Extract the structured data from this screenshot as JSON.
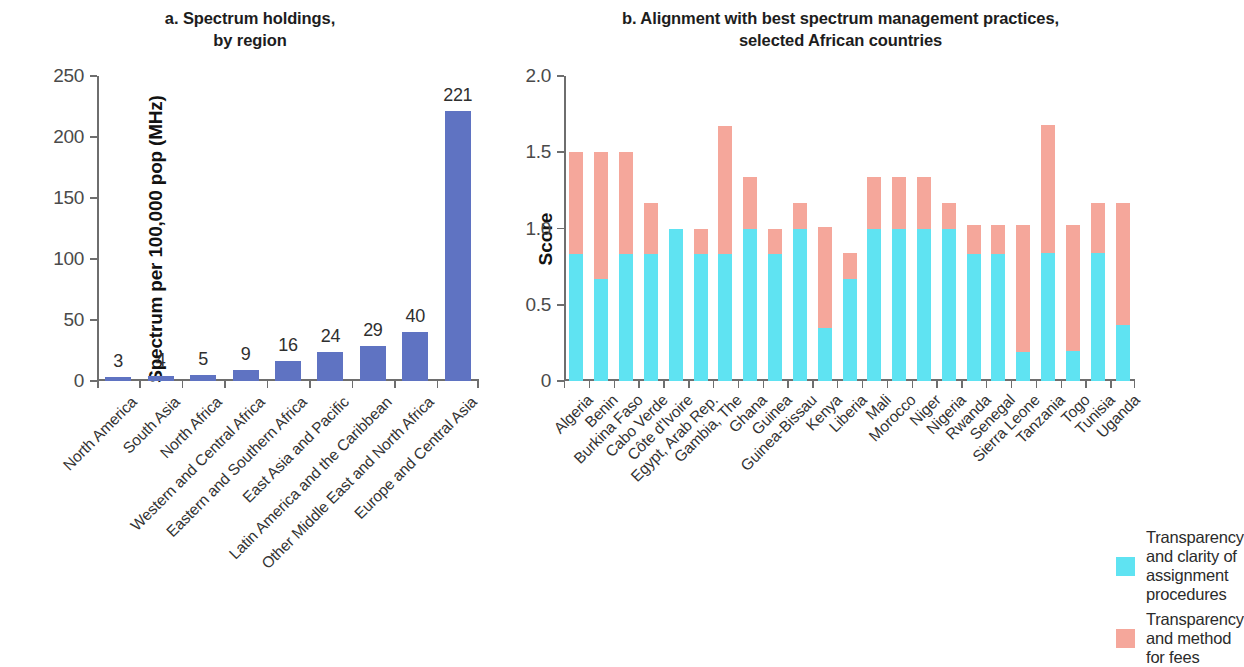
{
  "chart_data": [
    {
      "type": "bar",
      "panel": "a",
      "title": "a. Spectrum holdings,\nby region",
      "title_line1": "a. Spectrum holdings,",
      "title_line2": "by region",
      "xlabel": "",
      "ylabel": "Spectrum per 100,000 pop (MHz)",
      "ylim": [
        0,
        250
      ],
      "yticks": [
        0,
        50,
        100,
        150,
        200,
        250
      ],
      "ytick_labels": [
        "0",
        "50",
        "100",
        "150",
        "200",
        "250"
      ],
      "grid": false,
      "legend": "none",
      "bar_color": "#5f73c2",
      "categories": [
        "North America",
        "South Asia",
        "North Africa",
        "Western and Central Africa",
        "Eastern and Southern Africa",
        "East Asia and Pacific",
        "Latin America and the Caribbean",
        "Other Middle East and North Africa",
        "Europe and Central Asia"
      ],
      "values": [
        3,
        4,
        5,
        9,
        16,
        24,
        29,
        40,
        221
      ],
      "value_labels": [
        "3",
        "4",
        "5",
        "9",
        "16",
        "24",
        "29",
        "40",
        "221"
      ]
    },
    {
      "type": "bar",
      "panel": "b",
      "stacked": true,
      "title": "b. Alignment with best spectrum management practices,\nselected African countries",
      "title_line1": "b. Alignment with best spectrum management practices,",
      "title_line2": "selected African countries",
      "xlabel": "",
      "ylabel": "Score",
      "ylim": [
        0,
        2.0
      ],
      "yticks": [
        0,
        0.5,
        1.0,
        1.5,
        2.0
      ],
      "ytick_labels": [
        "0",
        "0.5",
        "1.0",
        "1.5",
        "2.0"
      ],
      "grid": false,
      "legend_position": "bottom-left",
      "categories": [
        "Algeria",
        "Benin",
        "Burkina Faso",
        "Cabo Verde",
        "Côte d'Ivoire",
        "Egypt, Arab Rep.",
        "Gambia, The",
        "Ghana",
        "Guinea",
        "Guinea-Bissau",
        "Kenya",
        "Liberia",
        "Mali",
        "Morocco",
        "Niger",
        "Nigeria",
        "Rwanda",
        "Senegal",
        "Sierra Leone",
        "Tanzania",
        "Togo",
        "Tunisia",
        "Uganda"
      ],
      "series": [
        {
          "name": "Transparency and clarity of assignment procedures",
          "color": "#5fe3f2",
          "values": [
            0.83,
            0.67,
            0.83,
            0.83,
            1.0,
            0.83,
            0.83,
            1.0,
            0.83,
            1.0,
            0.35,
            0.67,
            1.0,
            1.0,
            1.0,
            1.0,
            0.83,
            0.83,
            0.19,
            0.84,
            0.2,
            0.84,
            0.37
          ]
        },
        {
          "name": "Transparency and method for fees",
          "color": "#f5a79b",
          "values": [
            0.67,
            0.83,
            0.67,
            0.34,
            0.0,
            0.17,
            0.84,
            0.34,
            0.17,
            0.17,
            0.66,
            0.17,
            0.34,
            0.34,
            0.34,
            0.17,
            0.19,
            0.19,
            0.83,
            0.84,
            0.82,
            0.33,
            0.8
          ]
        }
      ],
      "totals": [
        1.5,
        1.5,
        1.5,
        1.17,
        1.0,
        1.0,
        1.67,
        1.34,
        1.0,
        1.17,
        1.01,
        0.84,
        1.34,
        1.34,
        1.34,
        1.17,
        1.02,
        1.02,
        1.02,
        1.68,
        1.02,
        1.17,
        1.17
      ]
    }
  ],
  "legend": {
    "items": [
      {
        "label": "Transparency and clarity of assignment procedures",
        "color": "#5fe3f2"
      },
      {
        "label": "Transparency and method for fees",
        "color": "#f5a79b"
      }
    ]
  }
}
